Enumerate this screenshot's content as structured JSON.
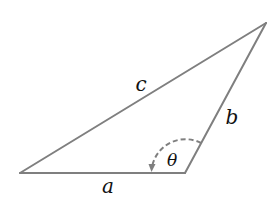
{
  "figure": {
    "type": "triangle",
    "stroke_color": "#7f7f7f",
    "label_color": "#111111",
    "vertices": {
      "left": {
        "x": 20,
        "y": 173
      },
      "bottom_right": {
        "x": 185,
        "y": 173
      },
      "top": {
        "x": 266,
        "y": 23
      }
    },
    "sides": [
      {
        "name": "a",
        "label": "a",
        "from": "left",
        "to": "bottom_right",
        "label_pos": {
          "x": 108,
          "y": 186
        }
      },
      {
        "name": "b",
        "label": "b",
        "from": "bottom_right",
        "to": "top",
        "label_pos": {
          "x": 232,
          "y": 117
        }
      },
      {
        "name": "c",
        "label": "c",
        "from": "left",
        "to": "top",
        "label_pos": {
          "x": 141,
          "y": 84
        }
      }
    ],
    "angle": {
      "label": "θ",
      "vertex": "bottom_right",
      "style": "dashed-arc-with-arrow",
      "label_pos": {
        "x": 172,
        "y": 160
      }
    }
  },
  "labels": {
    "a": "a",
    "b": "b",
    "c": "c",
    "theta": "θ"
  }
}
